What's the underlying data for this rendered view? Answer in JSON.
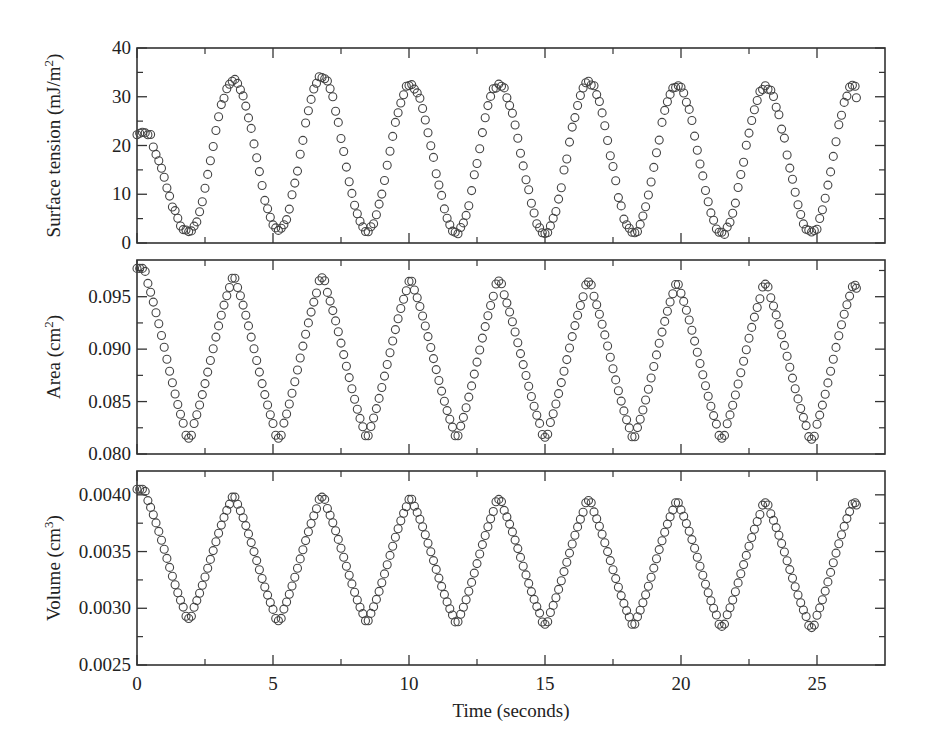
{
  "chart_data": {
    "type": "scatter",
    "marker": "open-circle",
    "shared_x": {
      "label": "Time (seconds)",
      "range": [
        0,
        27.5
      ],
      "ticks": [
        0,
        5,
        10,
        15,
        20,
        25
      ],
      "minor_ticks": [
        2.5,
        7.5,
        12.5,
        17.5,
        22.5
      ]
    },
    "period_seconds": 3.28,
    "peak_times": [
      0.2,
      3.55,
      6.8,
      10.05,
      13.3,
      16.6,
      19.85,
      23.1,
      26.35
    ],
    "trough_times": [
      1.9,
      5.2,
      8.45,
      11.75,
      15.0,
      18.25,
      21.5,
      24.8
    ],
    "panels": [
      {
        "id": "surface-tension",
        "ylabel": "Surface tension (mJ/m²)",
        "ylabel_main": "Surface tension (mJ/m",
        "ylabel_sup": "2",
        "ylabel_tail": ")",
        "ylim": [
          0,
          40
        ],
        "yticks": [
          0,
          10,
          20,
          30,
          40
        ],
        "ytick_labels": [
          "0",
          "10",
          "20",
          "30",
          "40"
        ],
        "yminor": [
          5,
          15,
          25,
          35
        ],
        "initial_value": 22.5,
        "peak_values": [
          22.5,
          33.5,
          34.0,
          32.5,
          32.5,
          33.0,
          32.3,
          32.0,
          32.5
        ],
        "trough_values": [
          2.2,
          2.5,
          2.3,
          2.2,
          2.1,
          2.0,
          1.9,
          1.9
        ],
        "end_value": 29.8
      },
      {
        "id": "area",
        "ylabel": "Area (cm²)",
        "ylabel_main": "Area (cm",
        "ylabel_sup": "2",
        "ylabel_tail": ")",
        "ylim": [
          0.08,
          0.0985
        ],
        "yticks": [
          0.08,
          0.085,
          0.09,
          0.095
        ],
        "ytick_labels": [
          "0.080",
          "0.085",
          "0.090",
          "0.095"
        ],
        "yminor": [
          0.0825,
          0.0875,
          0.0925,
          0.0975
        ],
        "peak_values": [
          0.0977,
          0.0969,
          0.0968,
          0.0966,
          0.0965,
          0.0964,
          0.0963,
          0.0962,
          0.0961
        ],
        "trough_values": [
          0.0815,
          0.0815,
          0.0816,
          0.0816,
          0.0816,
          0.0815,
          0.0815,
          0.0814
        ],
        "end_value": 0.0958
      },
      {
        "id": "volume",
        "ylabel": "Volume (cm³)",
        "ylabel_main": "Volume (cm",
        "ylabel_sup": "3",
        "ylabel_tail": ")",
        "ylim": [
          0.0025,
          0.00421
        ],
        "yticks": [
          0.0025,
          0.003,
          0.0035,
          0.004
        ],
        "ytick_labels": [
          "0.0025",
          "0.0030",
          "0.0035",
          "0.0040"
        ],
        "yminor": [
          0.00275,
          0.00325,
          0.00375
        ],
        "peak_values": [
          0.00405,
          0.00399,
          0.00398,
          0.00397,
          0.00396,
          0.00395,
          0.00394,
          0.00393,
          0.00393
        ],
        "trough_values": [
          0.00291,
          0.00289,
          0.00288,
          0.00287,
          0.00286,
          0.00285,
          0.00284,
          0.00283
        ],
        "end_value": 0.00391
      }
    ]
  }
}
